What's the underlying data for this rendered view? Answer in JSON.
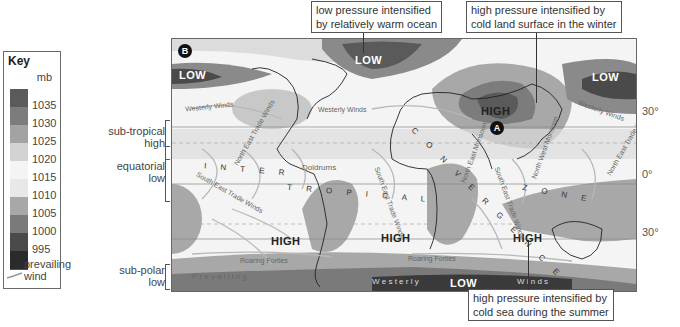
{
  "key": {
    "title": "Key",
    "unit": "mb",
    "swatches": [
      {
        "color": "#5a5a5a",
        "label": "1035"
      },
      {
        "color": "#7c7c7c",
        "label": "1030"
      },
      {
        "color": "#a3a3a3",
        "label": "1025"
      },
      {
        "color": "#d3d3d3",
        "label": "1020"
      },
      {
        "color": "#f4f4f4",
        "label": "1015"
      },
      {
        "color": "#e8e8e8",
        "label": "1010"
      },
      {
        "color": "#a8a8a8",
        "label": "1005"
      },
      {
        "color": "#7a7a7a",
        "label": "1000"
      },
      {
        "color": "#4a4a4a",
        "label": "995"
      },
      {
        "color": "#2b2b2b",
        "label": ""
      }
    ],
    "wind_label_line1": "prevailing",
    "wind_label_line2": "wind"
  },
  "bands": {
    "subtropical_line1": "sub-tropical",
    "subtropical_line2": "high",
    "equatorial_line1": "equatorial",
    "equatorial_line2": "low",
    "subpolar_line1": "sub-polar",
    "subpolar_line2": "low"
  },
  "latitudes": {
    "north30": "30°",
    "equator": "0°",
    "south30": "30°"
  },
  "callouts": {
    "top_left_line1": "low pressure intensified",
    "top_left_line2": "by relatively warm ocean",
    "top_right_line1": "high pressure intensified by",
    "top_right_line2": "cold land surface in the winter",
    "bottom_line1": "high pressure intensified by",
    "bottom_line2": "cold sea during the summer"
  },
  "map": {
    "marker_b": "B",
    "marker_a": "A",
    "pressure_labels": {
      "low_pacific_west": "LOW",
      "low_atlantic": "LOW",
      "high_siberia": "HIGH",
      "low_pacific_east": "LOW",
      "high_south_pacific": "HIGH",
      "high_south_atlantic": "HIGH",
      "high_indian_ocean": "HIGH",
      "low_southern_ocean": "LOW"
    },
    "wind_labels": {
      "westerly_1": "Westerly Winds",
      "westerly_2": "Westerly Winds",
      "westerly_3": "Westerly Winds",
      "ne_trade_1": "North East Trade Winds",
      "ne_trade_2": "North East Trade Winds",
      "se_trade_1": "South East Trade Winds",
      "se_trade_2": "South East Trade Winds",
      "se_trade_3": "South East Trade Winds",
      "ne_monsoon": "North East Monsoon",
      "nw_monsoon": "North West Monsoon",
      "doldrums": "Doldrums",
      "roaring_1": "Roaring Forties",
      "roaring_2": "Roaring Forties",
      "prevailing": "P r e v a i l i n g",
      "westerly_south": "W e s t e r l y",
      "winds_south": "W i n d s"
    },
    "itcz": {
      "part1": "I N T E R",
      "part2": "T R O P I C A L",
      "part3": "C O N V E R G E N C E",
      "part4": "Z O N E"
    }
  }
}
